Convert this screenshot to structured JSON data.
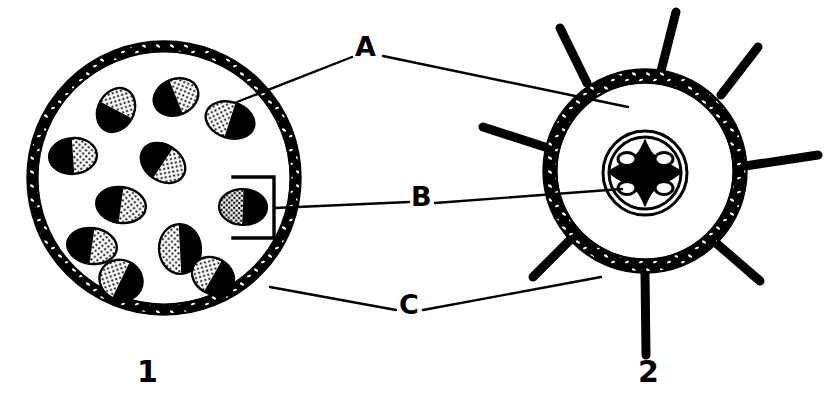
{
  "figure": {
    "background_color": "#ffffff",
    "ink_color": "#000000",
    "width": 827,
    "height": 415
  },
  "labels": {
    "callouts": [
      {
        "id": "A",
        "text": "A",
        "x": 365,
        "y": 47
      },
      {
        "id": "B",
        "text": "B",
        "x": 420,
        "y": 197
      },
      {
        "id": "C",
        "text": "C",
        "x": 408,
        "y": 305
      }
    ],
    "figure_numbers": [
      {
        "id": "fig1",
        "text": "1",
        "x": 148,
        "y": 372
      },
      {
        "id": "fig2",
        "text": "2",
        "x": 649,
        "y": 372
      }
    ]
  },
  "figure1": {
    "name": "monocot-stem-cross-section",
    "number": "1",
    "center_x": 164,
    "center_y": 178,
    "radius": 136,
    "epidermis_thickness": 9,
    "vascular_bundle_count": 13,
    "vascular_bundles": [
      {
        "cx": 176,
        "cy": 97,
        "rx": 23,
        "ry": 18,
        "rot": -22
      },
      {
        "cx": 115,
        "cy": 109,
        "rx": 22,
        "ry": 18,
        "rot": -70
      },
      {
        "cx": 229,
        "cy": 120,
        "rx": 24,
        "ry": 18,
        "rot": 22
      },
      {
        "cx": 72,
        "cy": 156,
        "rx": 23,
        "ry": 17,
        "rot": -6
      },
      {
        "cx": 163,
        "cy": 162,
        "rx": 23,
        "ry": 18,
        "rot": 38
      },
      {
        "cx": 121,
        "cy": 204,
        "rx": 24,
        "ry": 18,
        "rot": 10
      },
      {
        "cx": 243,
        "cy": 207,
        "rx": 23,
        "ry": 18,
        "rot": 3
      },
      {
        "cx": 91,
        "cy": 245,
        "rx": 24,
        "ry": 18,
        "rot": 12
      },
      {
        "cx": 180,
        "cy": 249,
        "rx": 21,
        "ry": 24,
        "rot": 0
      },
      {
        "cx": 121,
        "cy": 279,
        "rx": 21,
        "ry": 19,
        "rot": 28
      },
      {
        "cx": 212,
        "cy": 275,
        "rx": 21,
        "ry": 17,
        "rot": 32
      },
      {
        "cx": 203,
        "cy": 91,
        "rx": 0,
        "ry": 0,
        "rot": 0
      },
      {
        "cx": 60,
        "cy": 196,
        "rx": 0,
        "ry": 0,
        "rot": 0
      }
    ],
    "bracket": {
      "name": "bundle-bracket",
      "x": 255,
      "y_top": 176,
      "y_bottom": 238,
      "width": 22
    }
  },
  "figure2": {
    "name": "root-cross-section",
    "number": "2",
    "center_x": 645,
    "center_y": 171,
    "radius": 101,
    "cortex_thickness": 11,
    "root_hair_count": 8,
    "root_hairs_deg": [
      262,
      305,
      352,
      40,
      82,
      128,
      172,
      218
    ],
    "stele": {
      "name": "central-stele",
      "cx": 645,
      "cy": 173,
      "outer_r": 42,
      "inner_r": 35,
      "xylem_shape": "cross",
      "phloem_count": 4
    }
  },
  "leader_lines": {
    "A": [
      {
        "from_x": 352,
        "from_y": 56,
        "to_x": 237,
        "to_y": 102,
        "target": "figure1-ground-tissue"
      },
      {
        "from_x": 382,
        "from_y": 56,
        "to_x": 628,
        "to_y": 106,
        "target": "figure2-cortex"
      }
    ],
    "B": [
      {
        "from_x": 408,
        "from_y": 202,
        "to_x": 274,
        "to_y": 207,
        "target": "figure1-vascular-bundle"
      },
      {
        "from_x": 434,
        "from_y": 202,
        "to_x": 622,
        "to_y": 188,
        "target": "figure2-stele"
      }
    ],
    "C": [
      {
        "from_x": 396,
        "from_y": 310,
        "to_x": 271,
        "to_y": 287,
        "target": "figure1-epidermis"
      },
      {
        "from_x": 422,
        "from_y": 310,
        "to_x": 600,
        "to_y": 275,
        "target": "figure2-epidermis"
      }
    ]
  }
}
